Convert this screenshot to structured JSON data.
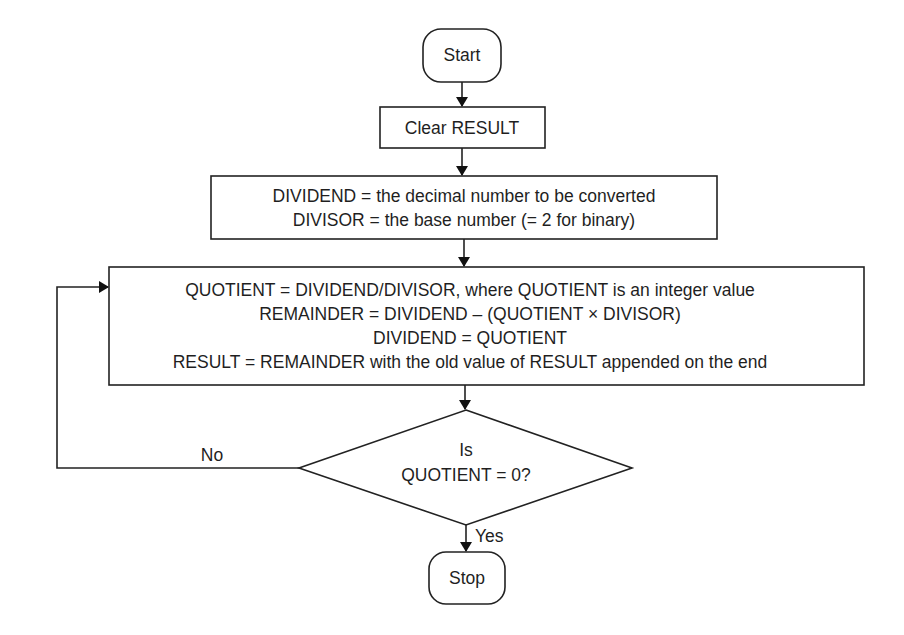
{
  "diagram": {
    "type": "flowchart",
    "nodes": {
      "start": {
        "kind": "terminator",
        "label": "Start"
      },
      "clear": {
        "kind": "process",
        "label": "Clear RESULT"
      },
      "init": {
        "kind": "process",
        "lines": [
          "DIVIDEND = the decimal number to be converted",
          "DIVISOR = the base number (= 2 for binary)"
        ]
      },
      "loop_body": {
        "kind": "process",
        "lines": [
          "QUOTIENT = DIVIDEND/DIVISOR, where QUOTIENT is an integer value",
          "REMAINDER = DIVIDEND – (QUOTIENT × DIVISOR)",
          "DIVIDEND = QUOTIENT",
          "RESULT = REMAINDER with the old value of RESULT appended on the end"
        ]
      },
      "decision": {
        "kind": "decision",
        "lines": [
          "Is",
          "QUOTIENT = 0?"
        ]
      },
      "stop": {
        "kind": "terminator",
        "label": "Stop"
      }
    },
    "edges": {
      "no_label": "No",
      "yes_label": "Yes"
    },
    "colors": {
      "stroke": "#222222",
      "text": "#1f1f1f",
      "background": "#ffffff"
    }
  }
}
